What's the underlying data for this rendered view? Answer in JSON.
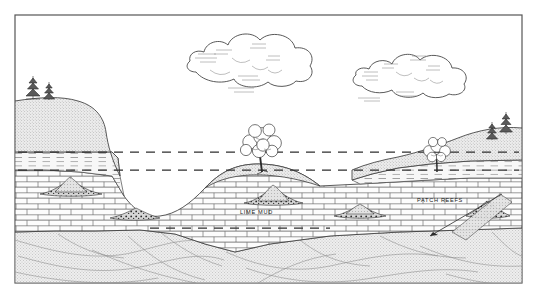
{
  "figure": {
    "frame": {
      "x": 15,
      "y": 15,
      "width": 507,
      "height": 268,
      "border_color": "#555555"
    }
  },
  "labels": [
    {
      "name": "lime-mud-label",
      "text": "LIME  MUD",
      "x": 240,
      "y": 212
    },
    {
      "name": "patch-reefs-label",
      "text": "PATCH  REEFS",
      "x": 417,
      "y": 201
    }
  ],
  "sky": {
    "background": "#ffffff",
    "clouds": [
      {
        "name": "cumulus-cloud-left",
        "cx": 258,
        "cy": 62,
        "scale": 1.0
      },
      {
        "name": "cumulus-cloud-right",
        "cx": 422,
        "cy": 72,
        "scale": 0.82
      }
    ]
  },
  "vegetation": [
    {
      "name": "pine-tree-left-outer",
      "type": "pine",
      "x": 33,
      "y": 93,
      "height": 28
    },
    {
      "name": "pine-tree-left-inner",
      "type": "pine",
      "x": 49,
      "y": 97,
      "height": 22
    },
    {
      "name": "broadleaf-tree-center",
      "type": "broadleaf",
      "x": 262,
      "y": 150,
      "height": 35
    },
    {
      "name": "broadleaf-tree-right",
      "type": "broadleaf",
      "x": 437,
      "y": 155,
      "height": 24
    },
    {
      "name": "pine-tree-right-inner",
      "type": "pine",
      "x": 492,
      "y": 134,
      "height": 22
    },
    {
      "name": "pine-tree-right-outer",
      "type": "pine",
      "x": 505,
      "y": 128,
      "height": 26
    }
  ],
  "sea_level_lines": [
    {
      "name": "dashed-sealevel-upper",
      "y": 152,
      "x1": 18,
      "x2": 519
    },
    {
      "name": "dashed-sealevel-lower",
      "y": 170,
      "x1": 18,
      "x2": 519
    },
    {
      "name": "dashed-basin-floor",
      "y": 228,
      "x1": 18,
      "x2": 519
    }
  ],
  "strata": [
    {
      "name": "stipple-cap-layer",
      "pattern": "stipple",
      "fill": "#e8e8e8",
      "description": "upper stippled sand/soil cap forming cliffs"
    },
    {
      "name": "laminated-layer",
      "pattern": "horizontal-dashes",
      "fill": "#f4f4f4",
      "description": "thin horizontally-laminated bed beneath cap"
    },
    {
      "name": "limestone-brick-layer",
      "pattern": "brick",
      "fill": "#fbfbfb",
      "description": "massive bedded limestone, brick ornament"
    },
    {
      "name": "basement-stipple-layer",
      "pattern": "stipple-swirl",
      "fill": "#ededed",
      "description": "lower stippled unit with curved cross-bedding"
    }
  ],
  "features": [
    {
      "name": "patch-reef-left",
      "cx": 70,
      "cy": 188
    },
    {
      "name": "patch-reef-center",
      "cx": 273,
      "cy": 197
    },
    {
      "name": "patch-reef-center-right",
      "cx": 360,
      "cy": 212
    },
    {
      "name": "patch-reef-right",
      "cx": 487,
      "cy": 210
    },
    {
      "name": "reef-leader-line",
      "x1": 430,
      "y1": 235,
      "x2": 500,
      "y2": 196
    }
  ],
  "colors": {
    "ink": "#1a1a1a",
    "line": "#4a4a4a",
    "frame": "#555555",
    "stipple_fill": "#e8e8e8",
    "brick_fill": "#fbfbfb",
    "basement_fill": "#ededed",
    "dash_line": "#3c3c3c"
  }
}
